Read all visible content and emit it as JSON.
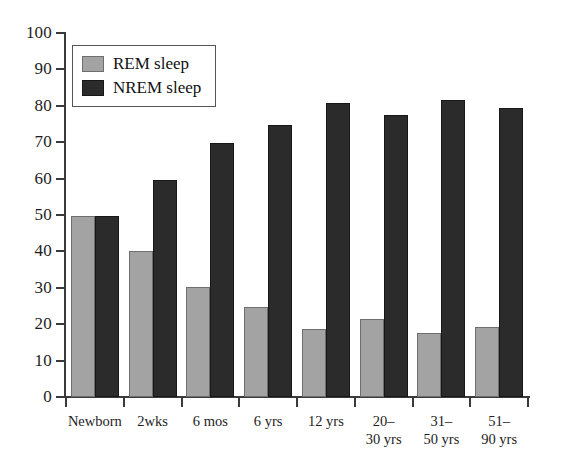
{
  "chart_data": {
    "type": "bar",
    "title": "",
    "xlabel": "",
    "ylabel": "",
    "ylim": [
      0,
      100
    ],
    "ytick_step": 10,
    "yticks": [
      0,
      10,
      20,
      30,
      40,
      50,
      60,
      70,
      80,
      90,
      100
    ],
    "grid": false,
    "legend_position": "top-left",
    "categories": [
      "Newborn",
      "2wks",
      "6 mos",
      "6 yrs",
      "12 yrs",
      "20–\n30 yrs",
      "31–\n50 yrs",
      "51–\n90 yrs"
    ],
    "category_lines": [
      [
        "Newborn"
      ],
      [
        "2wks"
      ],
      [
        "6 mos"
      ],
      [
        "6 yrs"
      ],
      [
        "12 yrs"
      ],
      [
        "20–",
        "30 yrs"
      ],
      [
        "31–",
        "50 yrs"
      ],
      [
        "51–",
        "90 yrs"
      ]
    ],
    "series": [
      {
        "name": "REM sleep",
        "color": "#a3a3a3",
        "values": [
          49.7,
          40.2,
          30.1,
          24.8,
          18.8,
          21.5,
          17.6,
          19.3
        ]
      },
      {
        "name": "NREM sleep",
        "color": "#2b2b2b",
        "values": [
          49.7,
          59.7,
          69.7,
          74.7,
          80.8,
          77.5,
          81.5,
          79.4
        ]
      }
    ]
  },
  "legend": {
    "items": [
      {
        "label": "REM sleep",
        "swatch": "rem"
      },
      {
        "label": "NREM sleep",
        "swatch": "nrem"
      }
    ]
  },
  "colors": {
    "rem": "#a3a3a3",
    "nrem": "#2b2b2b",
    "axis": "#3a3a3a",
    "text": "#1d1d1d",
    "background": "#ffffff"
  }
}
